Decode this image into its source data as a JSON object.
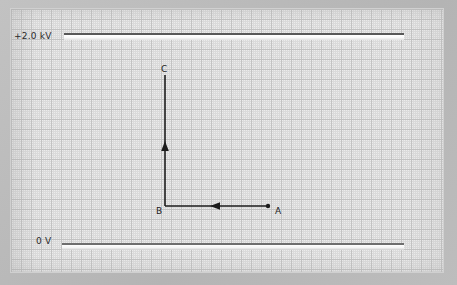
{
  "figure": {
    "type": "physics-diagram"
  },
  "plates": {
    "top": {
      "label": "+2.0 kV",
      "name": "positive-plate"
    },
    "bottom": {
      "label": "0 V",
      "name": "ground-plate"
    }
  },
  "points": {
    "a": {
      "label": "A"
    },
    "b": {
      "label": "B"
    },
    "c": {
      "label": "C"
    }
  },
  "path": {
    "segment_1": {
      "from": "A",
      "to": "B",
      "direction": "left"
    },
    "segment_2": {
      "from": "B",
      "to": "C",
      "direction": "up"
    }
  },
  "colors": {
    "ink": "#1c1c1c",
    "plate_edge": "#585858",
    "grid_minor": "#dadada",
    "grid_major": "#c2c2c2",
    "paper": "#ececec",
    "margin": "#b9b9b9"
  }
}
